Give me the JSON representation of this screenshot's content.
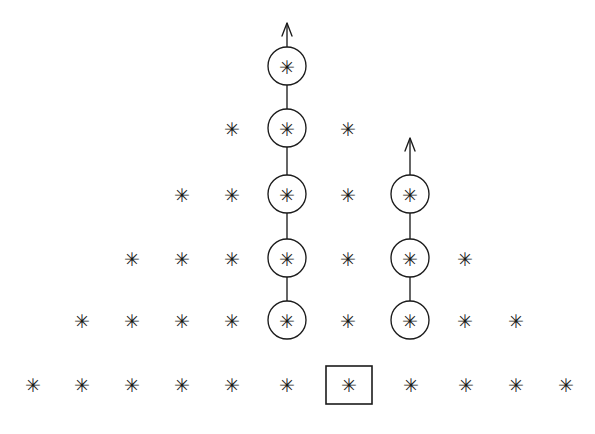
{
  "figure": {
    "name": "young-diagram-star-lattice",
    "width": 595,
    "height": 434,
    "background_color": "#ffffff",
    "ink_color": "#1b1b1b",
    "star_glyph": "✳",
    "star_char": "*"
  },
  "geometry": {
    "row_y": [
      66,
      128,
      194,
      258,
      320,
      384
    ],
    "col_spacing": 50,
    "circle_radius": 19,
    "box": {
      "x": 326,
      "y": 366,
      "width": 46,
      "height": 38
    }
  },
  "rows": [
    {
      "index": 0,
      "y": 66,
      "label": "row-1",
      "cells": [
        {
          "x": 287,
          "marker": "*",
          "decoration": "circle",
          "name": "cell-r1-c1"
        }
      ]
    },
    {
      "index": 1,
      "y": 128,
      "label": "row-2",
      "cells": [
        {
          "x": 232,
          "marker": "*",
          "decoration": "none",
          "name": "cell-r2-c1"
        },
        {
          "x": 287,
          "marker": "*",
          "decoration": "circle",
          "name": "cell-r2-c2"
        },
        {
          "x": 348,
          "marker": "*",
          "decoration": "none",
          "name": "cell-r2-c3"
        }
      ]
    },
    {
      "index": 2,
      "y": 194,
      "label": "row-3",
      "cells": [
        {
          "x": 182,
          "marker": "*",
          "decoration": "none",
          "name": "cell-r3-c1"
        },
        {
          "x": 232,
          "marker": "*",
          "decoration": "none",
          "name": "cell-r3-c2"
        },
        {
          "x": 287,
          "marker": "*",
          "decoration": "circle",
          "name": "cell-r3-c3"
        },
        {
          "x": 348,
          "marker": "*",
          "decoration": "none",
          "name": "cell-r3-c4"
        },
        {
          "x": 410,
          "marker": "*",
          "decoration": "circle",
          "name": "cell-r3-c5"
        }
      ]
    },
    {
      "index": 3,
      "y": 258,
      "label": "row-4",
      "cells": [
        {
          "x": 132,
          "marker": "*",
          "decoration": "none",
          "name": "cell-r4-c1"
        },
        {
          "x": 182,
          "marker": "*",
          "decoration": "none",
          "name": "cell-r4-c2"
        },
        {
          "x": 232,
          "marker": "*",
          "decoration": "none",
          "name": "cell-r4-c3"
        },
        {
          "x": 287,
          "marker": "*",
          "decoration": "circle",
          "name": "cell-r4-c4"
        },
        {
          "x": 348,
          "marker": "*",
          "decoration": "none",
          "name": "cell-r4-c5"
        },
        {
          "x": 410,
          "marker": "*",
          "decoration": "circle",
          "name": "cell-r4-c6"
        },
        {
          "x": 465,
          "marker": "*",
          "decoration": "none",
          "name": "cell-r4-c7"
        }
      ]
    },
    {
      "index": 4,
      "y": 320,
      "label": "row-5",
      "cells": [
        {
          "x": 82,
          "marker": "*",
          "decoration": "none",
          "name": "cell-r5-c1"
        },
        {
          "x": 132,
          "marker": "*",
          "decoration": "none",
          "name": "cell-r5-c2"
        },
        {
          "x": 182,
          "marker": "*",
          "decoration": "none",
          "name": "cell-r5-c3"
        },
        {
          "x": 232,
          "marker": "*",
          "decoration": "none",
          "name": "cell-r5-c4"
        },
        {
          "x": 287,
          "marker": "*",
          "decoration": "circle",
          "name": "cell-r5-c5"
        },
        {
          "x": 348,
          "marker": "*",
          "decoration": "none",
          "name": "cell-r5-c6"
        },
        {
          "x": 410,
          "marker": "*",
          "decoration": "circle",
          "name": "cell-r5-c7"
        },
        {
          "x": 465,
          "marker": "*",
          "decoration": "none",
          "name": "cell-r5-c8"
        },
        {
          "x": 516,
          "marker": "*",
          "decoration": "none",
          "name": "cell-r5-c9"
        }
      ]
    },
    {
      "index": 5,
      "y": 384,
      "label": "row-6",
      "cells": [
        {
          "x": 33,
          "marker": "*",
          "decoration": "none",
          "name": "cell-r6-c1"
        },
        {
          "x": 82,
          "marker": "*",
          "decoration": "none",
          "name": "cell-r6-c2"
        },
        {
          "x": 132,
          "marker": "*",
          "decoration": "none",
          "name": "cell-r6-c3"
        },
        {
          "x": 182,
          "marker": "*",
          "decoration": "none",
          "name": "cell-r6-c4"
        },
        {
          "x": 232,
          "marker": "*",
          "decoration": "none",
          "name": "cell-r6-c5"
        },
        {
          "x": 287,
          "marker": "*",
          "decoration": "none",
          "name": "cell-r6-c6"
        },
        {
          "x": 349,
          "marker": "*",
          "decoration": "box",
          "name": "cell-r6-c7"
        },
        {
          "x": 411,
          "marker": "*",
          "decoration": "none",
          "name": "cell-r6-c8"
        },
        {
          "x": 466,
          "marker": "*",
          "decoration": "none",
          "name": "cell-r6-c9"
        },
        {
          "x": 516,
          "marker": "*",
          "decoration": "none",
          "name": "cell-r6-c10"
        },
        {
          "x": 566,
          "marker": "*",
          "decoration": "none",
          "name": "cell-r6-c11"
        }
      ]
    }
  ],
  "chains": [
    {
      "name": "left-chain",
      "x": 287,
      "from_y": 320,
      "to_y": 66,
      "arrow_tip_y": 23,
      "circle_count": 5
    },
    {
      "name": "right-chain",
      "x": 410,
      "from_y": 320,
      "to_y": 194,
      "arrow_tip_y": 138,
      "circle_count": 3
    }
  ]
}
